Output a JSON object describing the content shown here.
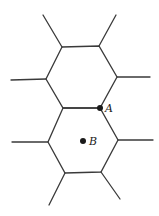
{
  "diagram": {
    "type": "hexagonal-lattice",
    "colors": {
      "line": "#3a3a3a",
      "point": "#1a1a1a",
      "background": "#ffffff"
    },
    "points": [
      {
        "id": "A",
        "label": "A",
        "x": 100,
        "y": 108,
        "role": "shared vertex"
      },
      {
        "id": "B",
        "label": "B",
        "x": 83,
        "y": 141,
        "role": "center of lower hexagon"
      }
    ]
  }
}
